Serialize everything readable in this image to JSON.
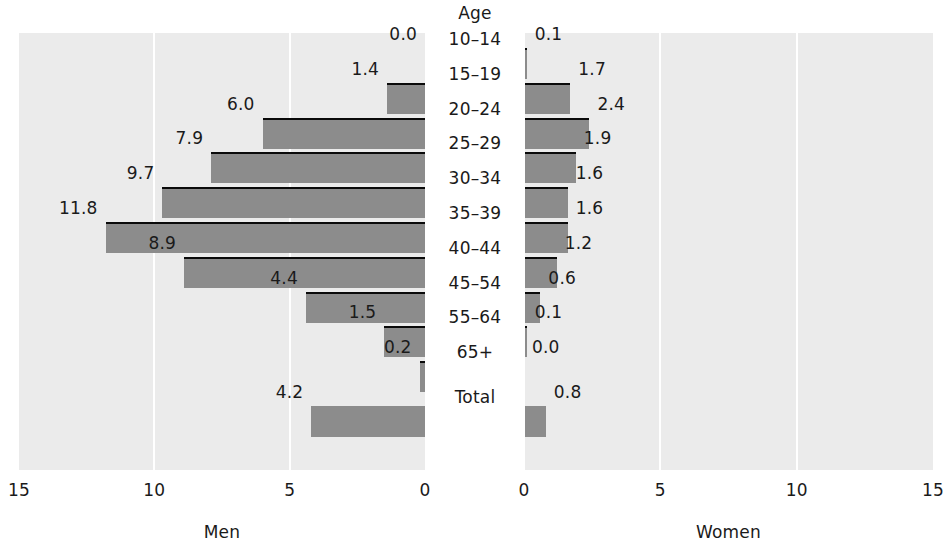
{
  "chart_data": {
    "type": "bar",
    "title": "",
    "center_axis_label": "Age",
    "categories": [
      "10–14",
      "15–19",
      "20–24",
      "25–29",
      "30–34",
      "35–39",
      "40–44",
      "45–54",
      "55–64",
      "65+",
      "Total"
    ],
    "series": [
      {
        "name": "Men",
        "direction": "left",
        "values": [
          0.0,
          1.4,
          6.0,
          7.9,
          9.7,
          11.8,
          8.9,
          4.4,
          1.5,
          0.2,
          4.2
        ],
        "labels": [
          "0.0",
          "1.4",
          "6.0",
          "7.9",
          "9.7",
          "11.8",
          "8.9",
          "4.4",
          "1.5",
          "0.2",
          "4.2"
        ]
      },
      {
        "name": "Women",
        "direction": "right",
        "values": [
          0.1,
          1.7,
          2.4,
          1.9,
          1.6,
          1.6,
          1.2,
          0.6,
          0.1,
          0.0,
          0.8
        ],
        "labels": [
          "0.1",
          "1.7",
          "2.4",
          "1.9",
          "1.6",
          "1.6",
          "1.2",
          "0.6",
          "0.1",
          "0.0",
          "0.8"
        ]
      }
    ],
    "xlim": [
      0,
      15
    ],
    "xticks_left": [
      "15",
      "10",
      "5",
      "0"
    ],
    "xticks_right": [
      "0",
      "5",
      "10",
      "15"
    ],
    "xlabel_left": "Men",
    "xlabel_right": "Women",
    "ylabel": "Age",
    "grid": true,
    "gridlines_at": [
      5,
      10
    ],
    "legend": "none",
    "colors": {
      "bar": "#8c8c8c",
      "panel_background": "#ebebeb",
      "gridline": "#ffffff",
      "separator": "#0a0a0a",
      "text": "#1a1a1a"
    }
  }
}
